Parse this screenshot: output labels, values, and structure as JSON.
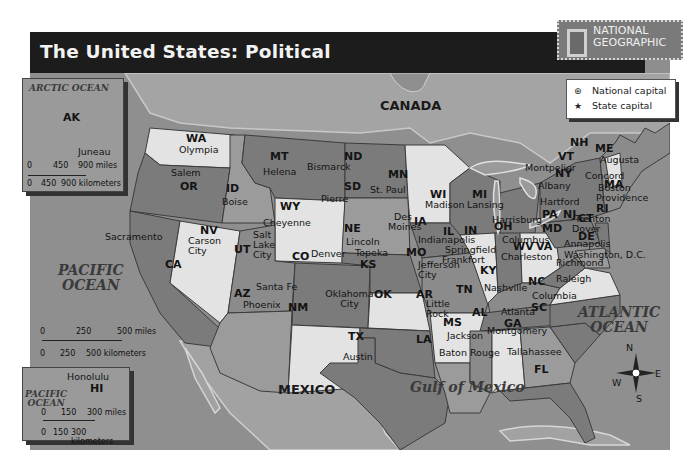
{
  "title": "The United States: Political",
  "brand": {
    "line1": "NATIONAL",
    "line2": "GEOGRAPHIC"
  },
  "legend": [
    {
      "symbol": "⊛",
      "label": "National capital"
    },
    {
      "symbol": "★",
      "label": "State capital"
    }
  ],
  "water_bodies": {
    "pacific_main": [
      "PACIFIC",
      "OCEAN"
    ],
    "atlantic": [
      "ATLANTIC",
      "OCEAN"
    ],
    "gulf": "Gulf of Mexico",
    "arctic": "ARCTIC OCEAN",
    "pacific_inset": [
      "PACIFIC",
      "OCEAN"
    ]
  },
  "countries": {
    "canada": "CANADA",
    "mexico": "MEXICO"
  },
  "alaska_inset": {
    "state": "AK",
    "capital": "Juneau",
    "scale_miles": [
      "0",
      "450",
      "900 miles"
    ],
    "scale_km": [
      "0",
      "450",
      "900 kilometers"
    ]
  },
  "hawaii_inset": {
    "state": "HI",
    "capital": "Honolulu",
    "scale_miles": [
      "0",
      "150",
      "300 miles"
    ],
    "scale_km": [
      "0",
      "150",
      "300 kilometers"
    ]
  },
  "main_scale": {
    "miles": [
      "0",
      "250",
      "500 miles"
    ],
    "km": [
      "0",
      "250",
      "500 kilometers"
    ]
  },
  "compass": {
    "n": "N",
    "s": "S",
    "e": "E",
    "w": "W"
  },
  "states": [
    {
      "abbr": "WA",
      "capital": "Olympia"
    },
    {
      "abbr": "OR",
      "capital": "Salem"
    },
    {
      "abbr": "CA",
      "capital": "Sacramento"
    },
    {
      "abbr": "ID",
      "capital": "Boise"
    },
    {
      "abbr": "NV",
      "capital": "Carson City"
    },
    {
      "abbr": "MT",
      "capital": "Helena"
    },
    {
      "abbr": "WY",
      "capital": "Cheyenne"
    },
    {
      "abbr": "UT",
      "capital": "Salt Lake City"
    },
    {
      "abbr": "CO",
      "capital": "Denver"
    },
    {
      "abbr": "AZ",
      "capital": "Phoenix"
    },
    {
      "abbr": "NM",
      "capital": "Santa Fe"
    },
    {
      "abbr": "ND",
      "capital": "Bismarck"
    },
    {
      "abbr": "SD",
      "capital": "Pierre"
    },
    {
      "abbr": "NE",
      "capital": "Lincoln"
    },
    {
      "abbr": "KS",
      "capital": "Topeka"
    },
    {
      "abbr": "OK",
      "capital": "Oklahoma City"
    },
    {
      "abbr": "TX",
      "capital": "Austin"
    },
    {
      "abbr": "MN",
      "capital": "St. Paul"
    },
    {
      "abbr": "IA",
      "capital": "Des Moines"
    },
    {
      "abbr": "MO",
      "capital": "Jefferson City"
    },
    {
      "abbr": "AR",
      "capital": "Little Rock"
    },
    {
      "abbr": "LA",
      "capital": "Baton Rouge"
    },
    {
      "abbr": "WI",
      "capital": "Madison"
    },
    {
      "abbr": "IL",
      "capital": "Springfield"
    },
    {
      "abbr": "MI",
      "capital": "Lansing"
    },
    {
      "abbr": "IN",
      "capital": "Indianapolis"
    },
    {
      "abbr": "OH",
      "capital": "Columbus"
    },
    {
      "abbr": "KY",
      "capital": "Frankfort"
    },
    {
      "abbr": "TN",
      "capital": "Nashville"
    },
    {
      "abbr": "MS",
      "capital": "Jackson"
    },
    {
      "abbr": "AL",
      "capital": "Montgomery"
    },
    {
      "abbr": "GA",
      "capital": "Atlanta"
    },
    {
      "abbr": "FL",
      "capital": "Tallahassee"
    },
    {
      "abbr": "SC",
      "capital": "Columbia"
    },
    {
      "abbr": "NC",
      "capital": "Raleigh"
    },
    {
      "abbr": "VA",
      "capital": "Richmond"
    },
    {
      "abbr": "WV",
      "capital": "Charleston"
    },
    {
      "abbr": "MD",
      "capital": "Annapolis"
    },
    {
      "abbr": "DE",
      "capital": "Dover"
    },
    {
      "abbr": "PA",
      "capital": "Harrisburg"
    },
    {
      "abbr": "NJ",
      "capital": "Trenton"
    },
    {
      "abbr": "NY",
      "capital": "Albany"
    },
    {
      "abbr": "CT",
      "capital": "Hartford"
    },
    {
      "abbr": "RI",
      "capital": "Providence"
    },
    {
      "abbr": "MA",
      "capital": "Boston"
    },
    {
      "abbr": "VT",
      "capital": "Montpelier"
    },
    {
      "abbr": "NH",
      "capital": "Concord"
    },
    {
      "abbr": "ME",
      "capital": "Augusta"
    }
  ],
  "national_capital": "Washington, D.C."
}
